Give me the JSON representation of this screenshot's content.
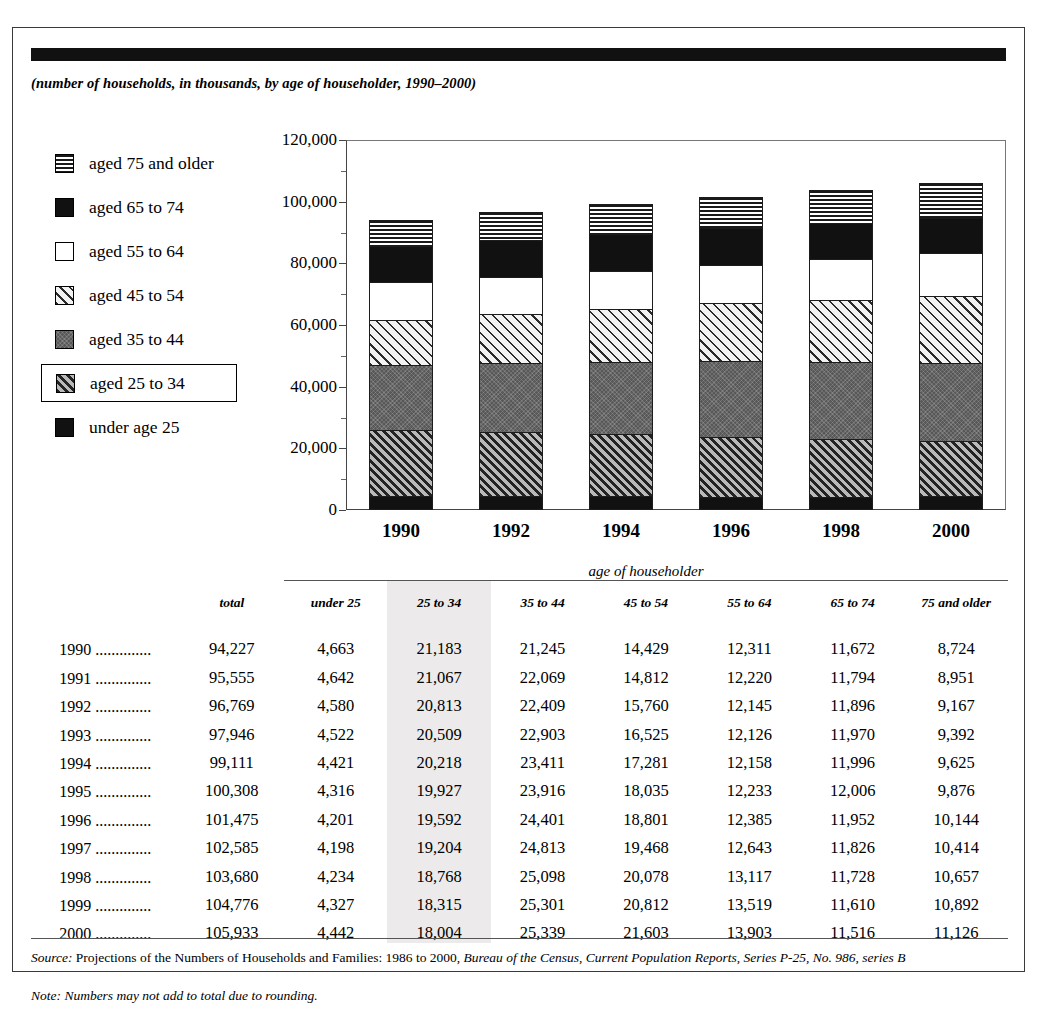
{
  "subtitle": "(number of households, in thousands, by age of householder, 1990–2000)",
  "legend": {
    "items": [
      {
        "label": "aged 75 and older",
        "pattern": "horizontal-lines",
        "boxed": false
      },
      {
        "label": "aged 65 to 74",
        "pattern": "solid-black",
        "boxed": false
      },
      {
        "label": "aged 55 to 64",
        "pattern": "white",
        "boxed": false
      },
      {
        "label": "aged 45 to 54",
        "pattern": "light-hatch",
        "boxed": false
      },
      {
        "label": "aged 35 to 44",
        "pattern": "gray",
        "boxed": false
      },
      {
        "label": "aged 25 to 34",
        "pattern": "dense-hatch",
        "boxed": true
      },
      {
        "label": "under age 25",
        "pattern": "solid-black",
        "boxed": false
      }
    ]
  },
  "chart_data": {
    "type": "bar",
    "subtype": "stacked",
    "title": "",
    "subtitle": "(number of households, in thousands, by age of householder, 1990–2000)",
    "xlabel": "",
    "ylabel": "",
    "categories": [
      "1990",
      "1992",
      "1994",
      "1996",
      "1998",
      "2000"
    ],
    "ylim": [
      0,
      120000
    ],
    "yticks": [
      0,
      20000,
      40000,
      60000,
      80000,
      100000,
      120000
    ],
    "ytick_labels": [
      "0",
      "20,000",
      "40,000",
      "60,000",
      "80,000",
      "100,000",
      "120,000"
    ],
    "minor_tick_interval": 10000,
    "grid": false,
    "legend_position": "left",
    "stack_order_bottom_to_top": [
      "under 25",
      "25 to 34",
      "35 to 44",
      "45 to 54",
      "55 to 64",
      "65 to 74",
      "75 and older"
    ],
    "series": [
      {
        "name": "under 25",
        "pattern": "solid-black",
        "values": [
          4663,
          4580,
          4421,
          4201,
          4234,
          4442
        ]
      },
      {
        "name": "25 to 34",
        "pattern": "dense-hatch",
        "values": [
          21183,
          20813,
          20218,
          19592,
          18768,
          18004
        ]
      },
      {
        "name": "35 to 44",
        "pattern": "gray",
        "values": [
          21245,
          22409,
          23411,
          24401,
          25098,
          25339
        ]
      },
      {
        "name": "45 to 54",
        "pattern": "light-hatch",
        "values": [
          14429,
          15760,
          17281,
          18801,
          20078,
          21603
        ]
      },
      {
        "name": "55 to 64",
        "pattern": "white",
        "values": [
          12311,
          12145,
          12158,
          12385,
          13117,
          13903
        ]
      },
      {
        "name": "65 to 74",
        "pattern": "solid-black",
        "values": [
          11672,
          11896,
          11996,
          11952,
          11728,
          11516
        ]
      },
      {
        "name": "75 and older",
        "pattern": "horizontal-lines",
        "values": [
          8724,
          9167,
          9625,
          10144,
          10657,
          11126
        ]
      }
    ],
    "totals": [
      94227,
      96769,
      99111,
      101475,
      103680,
      105933
    ]
  },
  "table": {
    "group_header": "age of householder",
    "columns": [
      "",
      "total",
      "under 25",
      "25 to 34",
      "35 to 44",
      "45 to 54",
      "55 to 64",
      "65 to 74",
      "75 and older"
    ],
    "highlighted_column": "25 to 34",
    "rows": [
      {
        "year": "1990 ..............",
        "total": "94,227",
        "cells": [
          "4,663",
          "21,183",
          "21,245",
          "14,429",
          "12,311",
          "11,672",
          "8,724"
        ]
      },
      {
        "year": "1991 ..............",
        "total": "95,555",
        "cells": [
          "4,642",
          "21,067",
          "22,069",
          "14,812",
          "12,220",
          "11,794",
          "8,951"
        ]
      },
      {
        "year": "1992 ..............",
        "total": "96,769",
        "cells": [
          "4,580",
          "20,813",
          "22,409",
          "15,760",
          "12,145",
          "11,896",
          "9,167"
        ]
      },
      {
        "year": "1993 ..............",
        "total": "97,946",
        "cells": [
          "4,522",
          "20,509",
          "22,903",
          "16,525",
          "12,126",
          "11,970",
          "9,392"
        ]
      },
      {
        "year": "1994 ..............",
        "total": "99,111",
        "cells": [
          "4,421",
          "20,218",
          "23,411",
          "17,281",
          "12,158",
          "11,996",
          "9,625"
        ]
      },
      {
        "year": "1995 ..............",
        "total": "100,308",
        "cells": [
          "4,316",
          "19,927",
          "23,916",
          "18,035",
          "12,233",
          "12,006",
          "9,876"
        ]
      },
      {
        "year": "1996 ..............",
        "total": "101,475",
        "cells": [
          "4,201",
          "19,592",
          "24,401",
          "18,801",
          "12,385",
          "11,952",
          "10,144"
        ]
      },
      {
        "year": "1997 ..............",
        "total": "102,585",
        "cells": [
          "4,198",
          "19,204",
          "24,813",
          "19,468",
          "12,643",
          "11,826",
          "10,414"
        ]
      },
      {
        "year": "1998 ..............",
        "total": "103,680",
        "cells": [
          "4,234",
          "18,768",
          "25,098",
          "20,078",
          "13,117",
          "11,728",
          "10,657"
        ]
      },
      {
        "year": "1999 ..............",
        "total": "104,776",
        "cells": [
          "4,327",
          "18,315",
          "25,301",
          "20,812",
          "13,519",
          "11,610",
          "10,892"
        ]
      },
      {
        "year": "2000 ..............",
        "total": "105,933",
        "cells": [
          "4,442",
          "18,004",
          "25,339",
          "21,603",
          "13,903",
          "11,516",
          "11,126"
        ]
      }
    ]
  },
  "footnotes": {
    "source_label": "Source:",
    "source_text_1": " Projections of the Numbers of Households and Families: 1986 to 2000, ",
    "source_text_2": "Bureau of the Census, Current Population Reports, Series P-25, No. 986, series B",
    "note_label": "Note:",
    "note_text": " Numbers may not add to total due to rounding."
  },
  "colors": {
    "ink": "#000000",
    "rule": "#555555",
    "highlight": "#eceaea",
    "frame": "#3a3a3a"
  }
}
